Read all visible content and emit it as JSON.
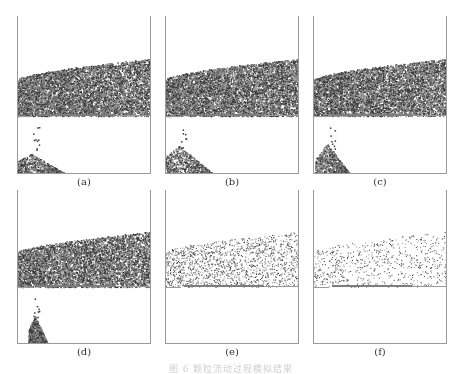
{
  "figure": {
    "panels": [
      {
        "id": "a",
        "label": "(a)",
        "x": 17,
        "y": 16,
        "w": 134,
        "h": 158,
        "density": 1.0,
        "pile": "wide",
        "pileH": 20
      },
      {
        "id": "b",
        "label": "(b)",
        "x": 165,
        "y": 16,
        "w": 134,
        "h": 158,
        "density": 1.0,
        "pile": "wide",
        "pileH": 28
      },
      {
        "id": "c",
        "label": "(c)",
        "x": 313,
        "y": 16,
        "w": 134,
        "h": 158,
        "density": 0.95,
        "pile": "medium",
        "pileH": 30
      },
      {
        "id": "d",
        "label": "(d)",
        "x": 17,
        "y": 190,
        "w": 134,
        "h": 154,
        "density": 0.85,
        "pile": "narrow",
        "pileH": 28
      },
      {
        "id": "e",
        "label": "(e)",
        "x": 165,
        "y": 190,
        "w": 134,
        "h": 154,
        "density": 0.22,
        "pile": "none",
        "pileH": 0
      },
      {
        "id": "f",
        "label": "(f)",
        "x": 313,
        "y": 190,
        "w": 134,
        "h": 154,
        "density": 0.1,
        "pile": "none",
        "pileH": 0
      }
    ],
    "caption": "图 6  颗粒流动过程模拟结果",
    "colors": {
      "frame": "#9a9a9a",
      "particle_dark": "#3a3a3a",
      "particle_light": "#8a8a8a",
      "plate": "#7d7d7d",
      "label": "#333333"
    }
  }
}
